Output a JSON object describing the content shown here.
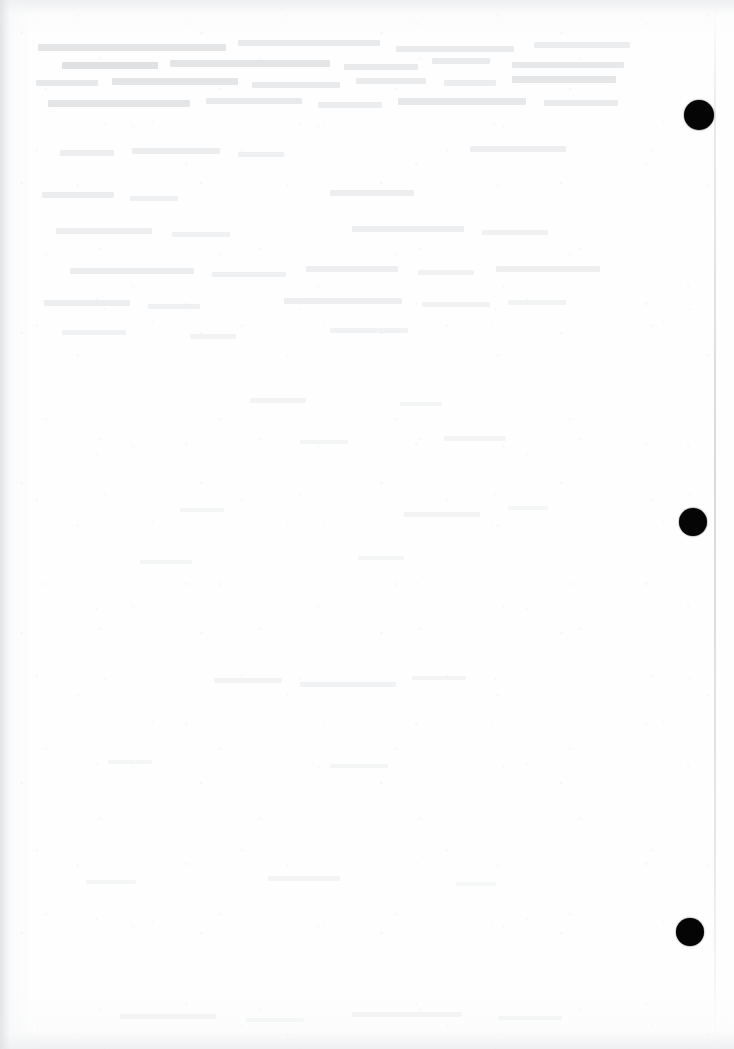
{
  "page": {
    "width": 734,
    "height": 1049,
    "background_color": "#ffffff",
    "paper_tone": "#fefefe",
    "content_text": "",
    "visible_text": ""
  },
  "marks": {
    "label": "registration-marks",
    "color": "#050505",
    "count": 3,
    "items": [
      {
        "name": "registration-mark-1",
        "cx": 699,
        "cy": 115,
        "r": 15
      },
      {
        "name": "registration-mark-2",
        "cx": 693,
        "cy": 522,
        "r": 14
      },
      {
        "name": "registration-mark-3",
        "cx": 690,
        "cy": 932,
        "r": 14
      }
    ]
  },
  "artifacts": {
    "page_edge_line": {
      "name": "page-edge-line",
      "x": 714,
      "color": "#cdced2"
    },
    "left_scan_band": {
      "name": "left-scan-band",
      "color": "#dcdde0"
    },
    "vignette_color": "#e8e9eb"
  },
  "ghost_text": {
    "label": "bleed-through-ghost-text",
    "color": "#a8acb2",
    "note": "faint illegible show-through from reverse side of sheet",
    "lines": [
      {
        "x": 38,
        "y": 44,
        "w": 188,
        "h": 7,
        "o": 0.3
      },
      {
        "x": 238,
        "y": 40,
        "w": 142,
        "h": 6,
        "o": 0.24
      },
      {
        "x": 396,
        "y": 46,
        "w": 118,
        "h": 6,
        "o": 0.22
      },
      {
        "x": 534,
        "y": 42,
        "w": 96,
        "h": 6,
        "o": 0.2
      },
      {
        "x": 62,
        "y": 62,
        "w": 96,
        "h": 7,
        "o": 0.34
      },
      {
        "x": 170,
        "y": 60,
        "w": 160,
        "h": 7,
        "o": 0.3
      },
      {
        "x": 344,
        "y": 64,
        "w": 74,
        "h": 6,
        "o": 0.24
      },
      {
        "x": 432,
        "y": 58,
        "w": 58,
        "h": 6,
        "o": 0.22
      },
      {
        "x": 512,
        "y": 62,
        "w": 112,
        "h": 6,
        "o": 0.26
      },
      {
        "x": 36,
        "y": 80,
        "w": 62,
        "h": 6,
        "o": 0.26
      },
      {
        "x": 112,
        "y": 78,
        "w": 126,
        "h": 7,
        "o": 0.3
      },
      {
        "x": 252,
        "y": 82,
        "w": 88,
        "h": 6,
        "o": 0.24
      },
      {
        "x": 356,
        "y": 78,
        "w": 70,
        "h": 6,
        "o": 0.22
      },
      {
        "x": 444,
        "y": 80,
        "w": 52,
        "h": 6,
        "o": 0.2
      },
      {
        "x": 512,
        "y": 76,
        "w": 104,
        "h": 7,
        "o": 0.28
      },
      {
        "x": 48,
        "y": 100,
        "w": 142,
        "h": 7,
        "o": 0.3
      },
      {
        "x": 206,
        "y": 98,
        "w": 96,
        "h": 6,
        "o": 0.24
      },
      {
        "x": 318,
        "y": 102,
        "w": 64,
        "h": 6,
        "o": 0.2
      },
      {
        "x": 398,
        "y": 98,
        "w": 128,
        "h": 7,
        "o": 0.26
      },
      {
        "x": 544,
        "y": 100,
        "w": 74,
        "h": 6,
        "o": 0.22
      },
      {
        "x": 60,
        "y": 150,
        "w": 54,
        "h": 6,
        "o": 0.18
      },
      {
        "x": 132,
        "y": 148,
        "w": 88,
        "h": 6,
        "o": 0.2
      },
      {
        "x": 238,
        "y": 152,
        "w": 46,
        "h": 5,
        "o": 0.16
      },
      {
        "x": 470,
        "y": 146,
        "w": 96,
        "h": 6,
        "o": 0.18
      },
      {
        "x": 42,
        "y": 192,
        "w": 72,
        "h": 6,
        "o": 0.2
      },
      {
        "x": 130,
        "y": 196,
        "w": 48,
        "h": 5,
        "o": 0.16
      },
      {
        "x": 330,
        "y": 190,
        "w": 84,
        "h": 6,
        "o": 0.18
      },
      {
        "x": 56,
        "y": 228,
        "w": 96,
        "h": 6,
        "o": 0.18
      },
      {
        "x": 172,
        "y": 232,
        "w": 58,
        "h": 5,
        "o": 0.15
      },
      {
        "x": 352,
        "y": 226,
        "w": 112,
        "h": 6,
        "o": 0.19
      },
      {
        "x": 482,
        "y": 230,
        "w": 66,
        "h": 5,
        "o": 0.15
      },
      {
        "x": 70,
        "y": 268,
        "w": 124,
        "h": 6,
        "o": 0.2
      },
      {
        "x": 212,
        "y": 272,
        "w": 74,
        "h": 5,
        "o": 0.16
      },
      {
        "x": 306,
        "y": 266,
        "w": 92,
        "h": 6,
        "o": 0.18
      },
      {
        "x": 418,
        "y": 270,
        "w": 56,
        "h": 5,
        "o": 0.14
      },
      {
        "x": 496,
        "y": 266,
        "w": 104,
        "h": 6,
        "o": 0.17
      },
      {
        "x": 44,
        "y": 300,
        "w": 86,
        "h": 6,
        "o": 0.19
      },
      {
        "x": 148,
        "y": 304,
        "w": 52,
        "h": 5,
        "o": 0.15
      },
      {
        "x": 284,
        "y": 298,
        "w": 118,
        "h": 6,
        "o": 0.18
      },
      {
        "x": 422,
        "y": 302,
        "w": 68,
        "h": 5,
        "o": 0.14
      },
      {
        "x": 508,
        "y": 300,
        "w": 58,
        "h": 5,
        "o": 0.13
      },
      {
        "x": 62,
        "y": 330,
        "w": 64,
        "h": 5,
        "o": 0.15
      },
      {
        "x": 190,
        "y": 334,
        "w": 46,
        "h": 5,
        "o": 0.13
      },
      {
        "x": 330,
        "y": 328,
        "w": 78,
        "h": 5,
        "o": 0.14
      },
      {
        "x": 250,
        "y": 398,
        "w": 56,
        "h": 5,
        "o": 0.12
      },
      {
        "x": 400,
        "y": 402,
        "w": 42,
        "h": 4,
        "o": 0.1
      },
      {
        "x": 300,
        "y": 440,
        "w": 48,
        "h": 4,
        "o": 0.1
      },
      {
        "x": 444,
        "y": 436,
        "w": 62,
        "h": 5,
        "o": 0.11
      },
      {
        "x": 180,
        "y": 508,
        "w": 44,
        "h": 4,
        "o": 0.1
      },
      {
        "x": 404,
        "y": 512,
        "w": 76,
        "h": 5,
        "o": 0.12
      },
      {
        "x": 508,
        "y": 506,
        "w": 40,
        "h": 4,
        "o": 0.09
      },
      {
        "x": 140,
        "y": 560,
        "w": 52,
        "h": 4,
        "o": 0.1
      },
      {
        "x": 358,
        "y": 556,
        "w": 46,
        "h": 4,
        "o": 0.09
      },
      {
        "x": 214,
        "y": 678,
        "w": 68,
        "h": 5,
        "o": 0.13
      },
      {
        "x": 300,
        "y": 682,
        "w": 96,
        "h": 5,
        "o": 0.14
      },
      {
        "x": 412,
        "y": 676,
        "w": 54,
        "h": 4,
        "o": 0.11
      },
      {
        "x": 108,
        "y": 760,
        "w": 44,
        "h": 4,
        "o": 0.09
      },
      {
        "x": 330,
        "y": 764,
        "w": 58,
        "h": 4,
        "o": 0.1
      },
      {
        "x": 86,
        "y": 880,
        "w": 50,
        "h": 4,
        "o": 0.09
      },
      {
        "x": 268,
        "y": 876,
        "w": 72,
        "h": 5,
        "o": 0.11
      },
      {
        "x": 456,
        "y": 882,
        "w": 40,
        "h": 4,
        "o": 0.08
      },
      {
        "x": 120,
        "y": 1014,
        "w": 96,
        "h": 5,
        "o": 0.12
      },
      {
        "x": 246,
        "y": 1018,
        "w": 58,
        "h": 4,
        "o": 0.1
      },
      {
        "x": 352,
        "y": 1012,
        "w": 110,
        "h": 5,
        "o": 0.12
      },
      {
        "x": 498,
        "y": 1016,
        "w": 64,
        "h": 4,
        "o": 0.1
      }
    ]
  }
}
